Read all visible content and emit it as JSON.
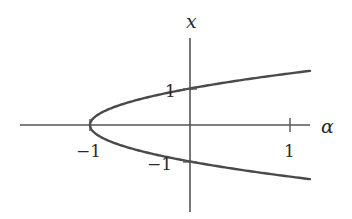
{
  "chart_data": {
    "type": "line",
    "title": "",
    "xlabel": "α",
    "ylabel": "x",
    "xlim": [
      -2.7,
      1.2
    ],
    "ylim": [
      -2.4,
      2.4
    ],
    "grid": false,
    "legend": null,
    "x_ticks": [
      {
        "value": -1,
        "label": "−1"
      },
      {
        "value": 1,
        "label": "1"
      }
    ],
    "y_ticks": [
      {
        "value": 1,
        "label": "1"
      },
      {
        "value": -1,
        "label": "−1"
      }
    ],
    "series": [
      {
        "name": "upper branch x = +sqrt(1+α)",
        "x": [
          -1,
          -0.9,
          -0.75,
          -0.5,
          -0.25,
          0,
          0.25,
          0.5,
          0.75,
          1,
          1.2
        ],
        "y": [
          0,
          0.316,
          0.5,
          0.707,
          0.866,
          1,
          1.118,
          1.225,
          1.323,
          1.414,
          1.483
        ]
      },
      {
        "name": "lower branch x = -sqrt(1+α)",
        "x": [
          -1,
          -0.9,
          -0.75,
          -0.5,
          -0.25,
          0,
          0.25,
          0.5,
          0.75,
          1,
          1.2
        ],
        "y": [
          0,
          -0.316,
          -0.5,
          -0.707,
          -0.866,
          -1,
          -1.118,
          -1.225,
          -1.323,
          -1.414,
          -1.483
        ]
      }
    ]
  },
  "labels": {
    "x_axis": "α",
    "y_axis": "x",
    "tick_alpha_neg1": "−1",
    "tick_alpha_1": "1",
    "tick_x_1": "1",
    "tick_x_neg1": "−1"
  },
  "colors": {
    "curve": "#4a4a4a",
    "axis": "#555555",
    "text": "#2a2a2a"
  }
}
